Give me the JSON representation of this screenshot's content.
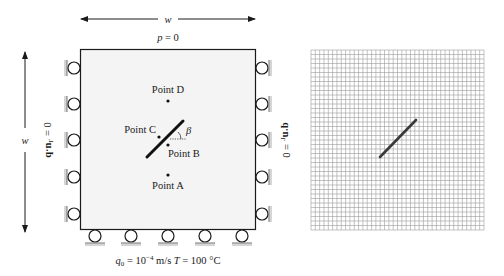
{
  "left_diagram": {
    "width_label_top": "w",
    "width_label_side": "w",
    "top_bc": "p = 0",
    "left_bc": "q·n",
    "left_bc_sub": "Γ",
    "left_bc_rhs": " = 0",
    "right_bc": "q·n",
    "right_bc_sub": "Γ",
    "right_bc_rhs": " = 0",
    "bottom_bc": {
      "q_symbol": "q",
      "q_sub": "0",
      "q_eq": " = 10",
      "q_exp": "−4",
      "q_unit": " m/s  ",
      "t_symbol": "T",
      "t_value": " = 100 °C"
    },
    "angle_label": "β",
    "points": [
      {
        "name": "Point D",
        "label": "Point D"
      },
      {
        "name": "Point C",
        "label": "Point C"
      },
      {
        "name": "Point B",
        "label": "Point B"
      },
      {
        "name": "Point A",
        "label": "Point A"
      }
    ],
    "colors": {
      "domain_fill": "#f4f4f4",
      "stroke": "#1a1a1a",
      "hatch": "#888888"
    }
  },
  "right_diagram": {
    "mesh_cells_x": 40,
    "mesh_cells_y": 40,
    "colors": {
      "grid": "#9a9a9a",
      "crack": "#3a3a3a"
    }
  }
}
